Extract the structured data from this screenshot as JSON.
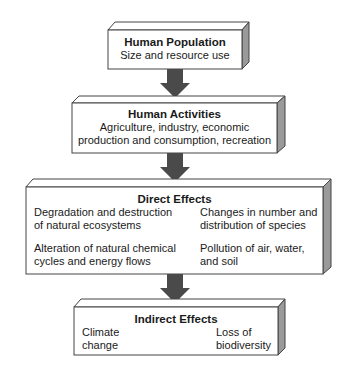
{
  "diagram": {
    "type": "flowchart",
    "direction": "top-to-bottom",
    "colors": {
      "box_face": "#ffffff",
      "box_side": "#9a9a9a",
      "box_top": "#ffffff",
      "outline": "#444444",
      "arrow": "#4a4a4a"
    },
    "boxes": [
      {
        "id": "human-population",
        "title": "Human Population",
        "lines": [
          "Size and resource use"
        ]
      },
      {
        "id": "human-activities",
        "title": "Human Activities",
        "lines": [
          "Agriculture, industry, economic",
          "production and consumption, recreation"
        ]
      },
      {
        "id": "direct-effects",
        "title": "Direct Effects",
        "items": [
          [
            "Degradation and destruction",
            "of natural ecosystems"
          ],
          [
            "Changes in number and",
            "distribution of species"
          ],
          [
            "Alteration of natural chemical",
            "cycles and energy flows"
          ],
          [
            "Pollution of air, water,",
            "and soil"
          ]
        ]
      },
      {
        "id": "indirect-effects",
        "title": "Indirect Effects",
        "items": [
          [
            "Climate",
            "change"
          ],
          [
            "Loss of",
            "biodiversity"
          ]
        ]
      }
    ],
    "arrows": [
      {
        "from": "human-population",
        "to": "human-activities"
      },
      {
        "from": "human-activities",
        "to": "direct-effects"
      },
      {
        "from": "direct-effects",
        "to": "indirect-effects"
      }
    ]
  }
}
